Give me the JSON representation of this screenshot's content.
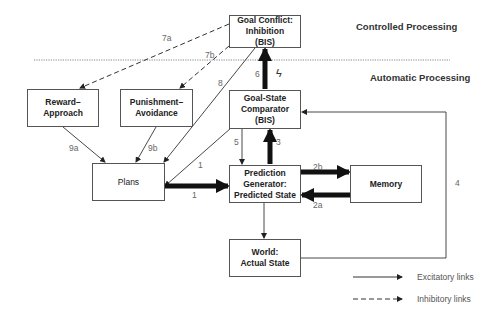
{
  "regions": {
    "controlled": "Controlled Processing",
    "automatic": "Automatic Processing"
  },
  "nodes": {
    "goal_conflict": "Goal Conflict:\nInhibition\n(BIS)",
    "reward": "Reward–\nApproach",
    "punishment": "Punishment–\nAvoidance",
    "comparator": "Goal-State\nComparator\n(BIS)",
    "plans": "Plans",
    "prediction": "Prediction\nGenerator:\nPredicted State",
    "memory": "Memory",
    "world": "World:\nActual State"
  },
  "edge_labels": {
    "l7a": "7a",
    "l7b": "7b",
    "l8": "8",
    "l6": "6",
    "l5": "5",
    "l3": "3",
    "l1a": "1",
    "l1b": "1",
    "l9a": "9a",
    "l9b": "9b",
    "l2b": "2b",
    "l2a": "2a",
    "l4": "4"
  },
  "symbols": {
    "bolt": "ϟ"
  },
  "legend": {
    "excitatory": "Excitatory links",
    "inhibitory": "Inhibitory links"
  }
}
